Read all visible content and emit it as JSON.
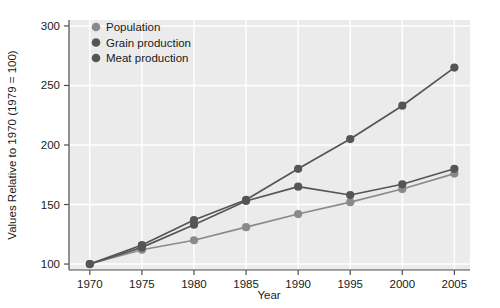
{
  "chart_data": {
    "type": "line",
    "title": "",
    "xlabel": "Year",
    "ylabel": "Values Relative to 1970 (1979 = 100)",
    "x": [
      1970,
      1975,
      1980,
      1985,
      1990,
      1995,
      2000,
      2005
    ],
    "xlim": [
      1968,
      2006.5
    ],
    "ylim": [
      95,
      305
    ],
    "xticks": [
      "1970",
      "1975",
      "1980",
      "1985",
      "1990",
      "1995",
      "2000",
      "2005"
    ],
    "yticks": [
      "100",
      "150",
      "200",
      "250",
      "300"
    ],
    "grid": true,
    "legend_position": "top-left-inside",
    "series": [
      {
        "name": "Population",
        "color": "#8a8a8a",
        "values": [
          100,
          112,
          120,
          131,
          142,
          152,
          163,
          176
        ]
      },
      {
        "name": "Grain production",
        "color": "#555555",
        "values": [
          100,
          114,
          133,
          153,
          165,
          158,
          167,
          180
        ]
      },
      {
        "name": "Meat production",
        "color": "#555555",
        "values": [
          100,
          116,
          137,
          154,
          180,
          205,
          233,
          265
        ]
      }
    ]
  },
  "style": {
    "plot_background": "#ebebeb",
    "grid_color": "#ffffff",
    "axis_color": "#4d4d4d",
    "text_color": "#1a1a1a",
    "page_background": "#ffffff"
  },
  "legend": {
    "items": [
      {
        "label": "Population",
        "marker": "legend-dot-population",
        "color": "#8a8a8a"
      },
      {
        "label": "Grain production",
        "marker": "legend-dot-grain",
        "color": "#555555"
      },
      {
        "label": "Meat production",
        "marker": "legend-dot-meat",
        "color": "#555555"
      }
    ]
  },
  "axes": {
    "x_title": "Year",
    "y_title": "Values Relative to 1970 (1979 = 100)"
  }
}
